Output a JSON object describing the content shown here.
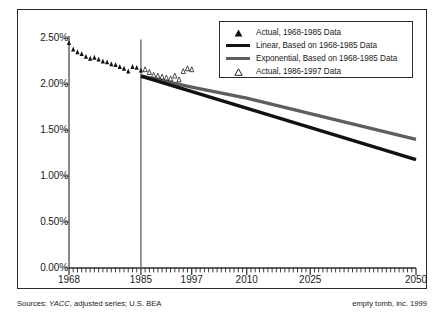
{
  "chart_data": {
    "type": "line",
    "title": "",
    "subtitle": "",
    "xlabel": "",
    "ylabel": "",
    "xlim": [
      1968,
      2050
    ],
    "ylim": [
      0.0,
      2.5
    ],
    "grid": false,
    "legend_position": "top-right",
    "y_ticks": [
      "0.00%",
      "0.50%",
      "1.00%",
      "1.50%",
      "2.00%",
      "2.50%"
    ],
    "y_tick_values": [
      0.0,
      0.5,
      1.0,
      1.5,
      2.0,
      2.5
    ],
    "x_ticks": [
      "1968",
      "1985",
      "1997",
      "2010",
      "2025",
      "2050"
    ],
    "x_tick_values": [
      1968,
      1985,
      1997,
      2010,
      2025,
      2050
    ],
    "annotations": [
      {
        "name": "divider-1985",
        "type": "vline",
        "x": 1985,
        "y_top": 2.5,
        "y_bottom": 0.0
      }
    ],
    "series": [
      {
        "name": "Actual, 1968-1985 Data",
        "marker": "filled-triangle",
        "color": "#111111",
        "x": [
          1968,
          1969,
          1970,
          1971,
          1972,
          1973,
          1974,
          1975,
          1976,
          1977,
          1978,
          1979,
          1980,
          1981,
          1982,
          1983,
          1984,
          1985
        ],
        "values": [
          2.45,
          2.38,
          2.35,
          2.33,
          2.3,
          2.28,
          2.29,
          2.27,
          2.25,
          2.24,
          2.22,
          2.21,
          2.19,
          2.17,
          2.14,
          2.19,
          2.18,
          2.15
        ]
      },
      {
        "name": "Actual, 1986-1997 Data",
        "marker": "open-triangle",
        "color": "#111111",
        "x": [
          1986,
          1987,
          1988,
          1989,
          1990,
          1991,
          1992,
          1993,
          1994,
          1995,
          1996,
          1997
        ],
        "values": [
          2.16,
          2.13,
          2.1,
          2.09,
          2.08,
          2.07,
          2.06,
          2.09,
          2.05,
          2.14,
          2.17,
          2.16
        ]
      },
      {
        "name": "Linear, Based on 1968-1985 Data",
        "marker": "none",
        "style": "solid-thick-black",
        "color": "#111111",
        "x": [
          1985,
          2050
        ],
        "values": [
          2.09,
          1.18
        ]
      },
      {
        "name": "Exponential, Based on 1968-1985 Data",
        "marker": "none",
        "style": "solid-thick-gray",
        "color": "#5e5e5e",
        "x": [
          1985,
          1997,
          2010,
          2025,
          2050
        ],
        "values": [
          2.09,
          1.97,
          1.85,
          1.68,
          1.4
        ]
      }
    ]
  },
  "legend": {
    "items": [
      {
        "key": "filled-triangle",
        "label": "Actual, 1968-1985 Data"
      },
      {
        "key": "black-line",
        "label": "Linear, Based on 1968-1985 Data"
      },
      {
        "key": "gray-line",
        "label": "Exponential, Based on 1968-1985 Data"
      },
      {
        "key": "open-triangle",
        "label": "Actual, 1986-1997 Data"
      }
    ]
  },
  "footer": {
    "sources_prefix": "Sources: ",
    "sources_italic": "YACC",
    "sources_rest": ", adjusted series; U.S. BEA",
    "credit": "empty tomb, inc. 1999"
  },
  "colors": {
    "linear_line": "#111111",
    "exponential_line": "#5e5e5e",
    "axis": "#6b6b6b",
    "frame": "#2b2b2b",
    "text": "#1a1a1a",
    "background": "#ffffff"
  }
}
